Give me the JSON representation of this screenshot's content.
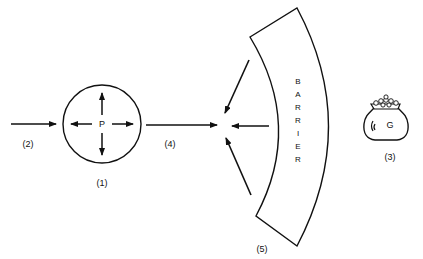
{
  "diagram": {
    "person": {
      "letter": "P",
      "label": "(1)"
    },
    "incoming_arrow": {
      "label": "(2)"
    },
    "goal": {
      "letter": "G",
      "label": "(3)"
    },
    "outgoing_arrow": {
      "label": "(4)"
    },
    "barrier": {
      "letters": [
        "B",
        "A",
        "R",
        "R",
        "I",
        "E",
        "R"
      ],
      "label": "(5)"
    }
  }
}
